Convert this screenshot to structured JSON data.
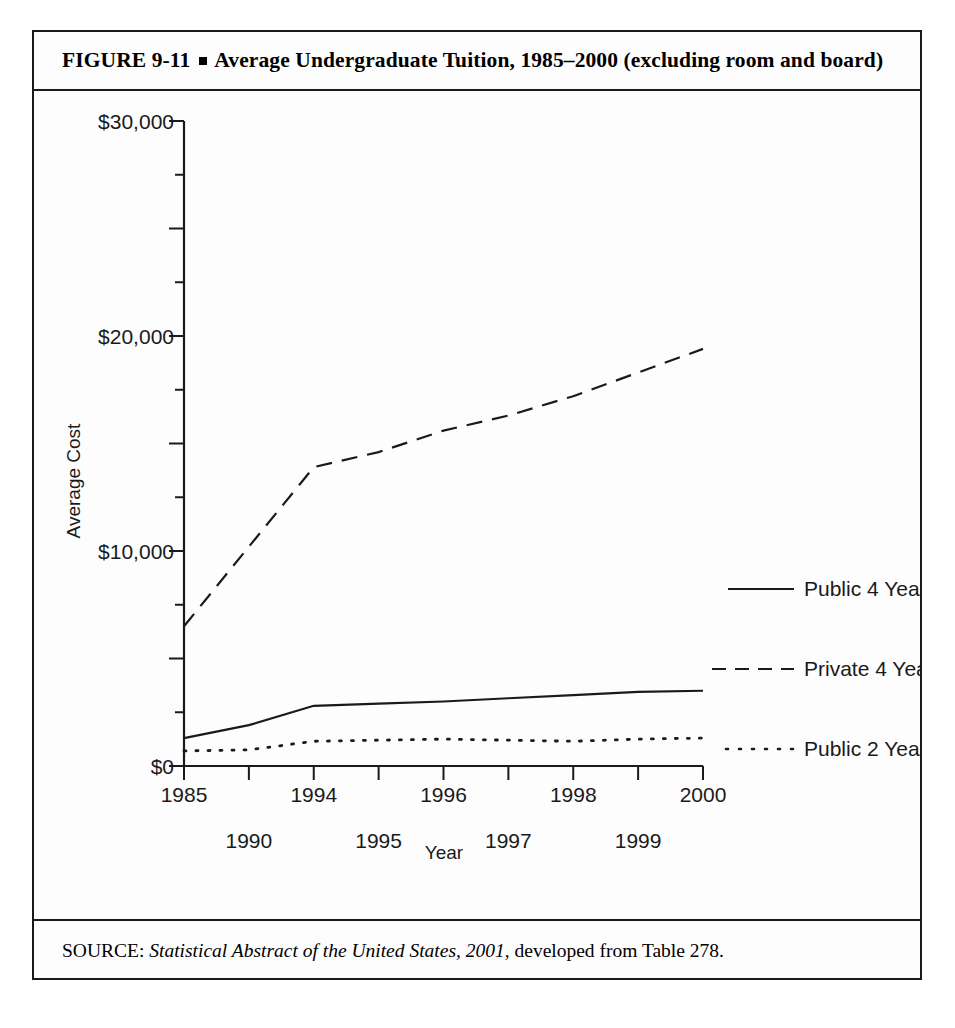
{
  "figure": {
    "number": "FIGURE  9-11",
    "bullet_icon": "square-bullet-icon",
    "title_text": "Average Undergraduate Tuition, 1985–2000 (excluding room and board)",
    "source_prefix": "SOURCE:",
    "source_italic": "Statistical Abstract of the United States, 2001,",
    "source_rest": "developed from Table 278."
  },
  "chart_data": {
    "type": "line",
    "title": "Average Undergraduate Tuition, 1985–2000 (excluding room and board)",
    "xlabel": "Year",
    "ylabel": "Average Cost",
    "categories": [
      "1985",
      "1990",
      "1994",
      "1995",
      "1996",
      "1997",
      "1998",
      "1999",
      "2000"
    ],
    "ylim": [
      0,
      30000
    ],
    "ytick_labels": [
      "$0",
      "$10,000",
      "$20,000",
      "$30,000"
    ],
    "ytick_values": [
      0,
      10000,
      20000,
      30000
    ],
    "yminor_step": 2500,
    "ymajor_step": 5000,
    "grid": false,
    "legend_position": "right",
    "series": [
      {
        "name": "Public 4 Year",
        "style": "solid",
        "values": [
          1300,
          1900,
          2800,
          2900,
          3000,
          3150,
          3300,
          3450,
          3500
        ]
      },
      {
        "name": "Private 4 Year",
        "style": "dashed",
        "values": [
          6500,
          10200,
          13900,
          14600,
          15600,
          16300,
          17200,
          18300,
          19400
        ]
      },
      {
        "name": "Public 2 Year",
        "style": "dotted",
        "values": [
          700,
          750,
          1150,
          1200,
          1250,
          1200,
          1150,
          1250,
          1300
        ]
      }
    ]
  },
  "axis": {
    "y_label": "Average Cost",
    "x_label": "Year"
  },
  "legend": {
    "items": [
      {
        "label": "Public 4 Year",
        "swatch": "solid-line-swatch"
      },
      {
        "label": "Private 4 Year",
        "swatch": "dashed-line-swatch"
      },
      {
        "label": "Public 2 Year",
        "swatch": "dotted-line-swatch"
      }
    ]
  }
}
